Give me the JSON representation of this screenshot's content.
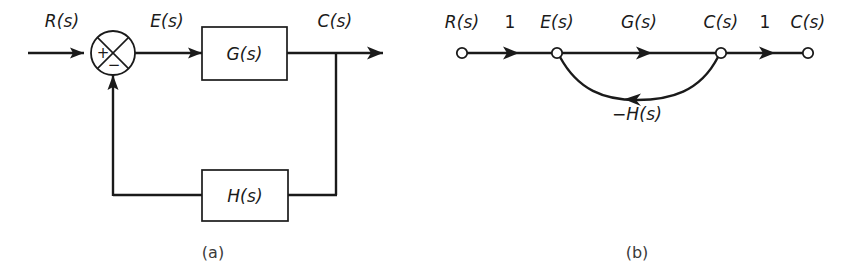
{
  "figure": {
    "background_color": "#ffffff",
    "line_color": "#1a1a1a",
    "type": "control-systems-diagram",
    "panels": [
      {
        "id": "a",
        "caption": "(a)",
        "kind": "block-diagram",
        "signals": {
          "input": "R(s)",
          "error": "E(s)",
          "output": "C(s)"
        },
        "blocks": [
          {
            "name": "forward-gain-block",
            "label": "G(s)"
          },
          {
            "name": "feedback-block",
            "label": "H(s)"
          }
        ],
        "summing_junction": {
          "name": "summing-junction",
          "positive_sign": "+",
          "negative_sign": "−"
        }
      },
      {
        "id": "b",
        "caption": "(b)",
        "kind": "signal-flow-graph",
        "nodes": [
          {
            "name": "node-r",
            "label": "R(s)"
          },
          {
            "name": "node-e",
            "label": "E(s)"
          },
          {
            "name": "node-c",
            "label": "C(s)"
          },
          {
            "name": "node-c-out",
            "label": "C(s)"
          }
        ],
        "branches": [
          {
            "name": "branch-r-to-e",
            "gain": "1"
          },
          {
            "name": "branch-e-to-c",
            "gain": "G(s)"
          },
          {
            "name": "branch-c-to-cout",
            "gain": "1"
          },
          {
            "name": "branch-feedback",
            "gain": "−H(s)"
          }
        ]
      }
    ]
  }
}
